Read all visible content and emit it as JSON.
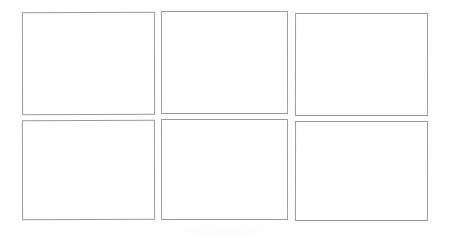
{
  "page": {
    "background_color": "#ffffff",
    "width": 449,
    "height": 238
  },
  "grid": {
    "rows": 2,
    "columns": 3,
    "border_color": "#9a9a9a",
    "fill_color": "#ffffff",
    "cells": [
      {
        "name": "cell-r1c1",
        "row": 1,
        "column": 1,
        "text": "",
        "x": 22,
        "y": 12,
        "width": 133,
        "height": 103
      },
      {
        "name": "cell-r1c2",
        "row": 1,
        "column": 2,
        "text": "",
        "x": 161,
        "y": 11,
        "width": 127,
        "height": 103
      },
      {
        "name": "cell-r1c3",
        "row": 1,
        "column": 3,
        "text": "",
        "x": 295,
        "y": 13,
        "width": 133,
        "height": 103
      },
      {
        "name": "cell-r2c1",
        "row": 2,
        "column": 1,
        "text": "",
        "x": 22,
        "y": 120,
        "width": 133,
        "height": 100
      },
      {
        "name": "cell-r2c2",
        "row": 2,
        "column": 2,
        "text": "",
        "x": 161,
        "y": 119,
        "width": 127,
        "height": 101
      },
      {
        "name": "cell-r2c3",
        "row": 2,
        "column": 3,
        "text": "",
        "x": 295,
        "y": 121,
        "width": 133,
        "height": 100
      }
    ]
  }
}
